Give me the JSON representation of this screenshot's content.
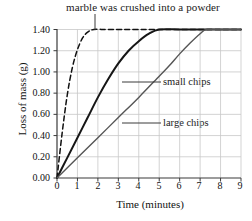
{
  "chart_data": {
    "type": "line",
    "title": "marble was crushed into a powder",
    "xlabel": "Time (minutes)",
    "ylabel": "Loss of mass (g)",
    "xlim": [
      0,
      9
    ],
    "ylim": [
      0.0,
      1.4
    ],
    "grid": true,
    "legend_position": "inline-annotations",
    "x_ticks": [
      "0",
      "1",
      "2",
      "3",
      "4",
      "5",
      "6",
      "7",
      "8",
      "9"
    ],
    "y_ticks": [
      "0.00",
      "0.20",
      "0.40",
      "0.60",
      "0.80",
      "1.00",
      "1.20",
      "1.40"
    ],
    "annotations": [
      {
        "text": "marble was crushed into a powder",
        "points_to_series": "powder",
        "leader": true
      },
      {
        "text": "small chips",
        "points_to_series": "small chips",
        "leader": true
      },
      {
        "text": "large chips",
        "points_to_series": "large chips",
        "leader": true
      }
    ],
    "series": [
      {
        "name": "powder",
        "style": "dashed",
        "color": "#111111",
        "x": [
          0,
          0.25,
          0.5,
          0.75,
          1.0,
          1.25,
          1.5,
          1.8,
          2.5,
          4,
          6,
          9
        ],
        "values": [
          0.0,
          0.42,
          0.78,
          1.04,
          1.21,
          1.32,
          1.375,
          1.4,
          1.4,
          1.4,
          1.4,
          1.4
        ]
      },
      {
        "name": "small chips",
        "style": "solid",
        "color": "#161616",
        "x": [
          0,
          0.5,
          1,
          1.5,
          2,
          2.5,
          3,
          3.5,
          4,
          4.5,
          5,
          6,
          7,
          8,
          9
        ],
        "values": [
          0.0,
          0.19,
          0.38,
          0.57,
          0.76,
          0.93,
          1.08,
          1.2,
          1.29,
          1.36,
          1.4,
          1.4,
          1.4,
          1.4,
          1.4
        ]
      },
      {
        "name": "large chips",
        "style": "solid",
        "color": "#555555",
        "x": [
          0,
          1,
          2,
          3,
          4,
          5,
          5.5,
          6,
          6.5,
          7,
          7.3,
          8,
          9
        ],
        "values": [
          0.0,
          0.19,
          0.38,
          0.57,
          0.76,
          0.96,
          1.06,
          1.17,
          1.27,
          1.36,
          1.4,
          1.4,
          1.4
        ]
      }
    ]
  }
}
